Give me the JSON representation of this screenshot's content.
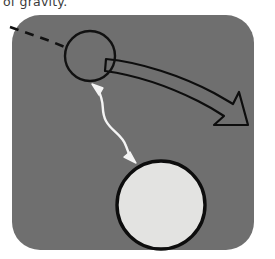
{
  "document": {
    "caption_fragment": "of gravity.",
    "figure_name": "gravitational-deflection-diagram"
  },
  "figure": {
    "panel": {
      "label": "illustration-panel",
      "fill": "#6f6f6f",
      "x": 12,
      "y": 15,
      "width": 242,
      "height": 235,
      "corner_radius": 28
    },
    "small_body": {
      "label": "small-circle-object",
      "cx": 90,
      "cy": 56,
      "r": 25,
      "fill": "none",
      "stroke": "#111111",
      "stroke_width": 2.4
    },
    "large_body": {
      "label": "large-circle-mass",
      "cx": 161,
      "cy": 205,
      "r": 44,
      "fill": "#e3e3e1",
      "stroke": "#0d0d0d",
      "stroke_width": 3.4
    },
    "incoming_path": {
      "label": "dashed-incoming-trajectory",
      "stroke": "#111111",
      "stroke_width": 2.6,
      "dash_pattern": "9 7",
      "start_x": 10,
      "start_y": 27,
      "end_x": 66,
      "end_y": 48
    },
    "deflected_path": {
      "label": "curved-deflection-arrow",
      "stroke": "#0d0d0d",
      "stroke_width": 2.2,
      "fill": "#6f6f6f",
      "tail_x": 108,
      "tail_y": 63,
      "tip_x": 246,
      "tip_y": 122
    },
    "attraction_arrow": {
      "label": "wavy-gravity-arrow",
      "stroke": "#f4f4f4",
      "stroke_width": 2.4,
      "double_headed": true,
      "top_x": 96,
      "top_y": 88,
      "bottom_x": 131,
      "bottom_y": 157
    }
  },
  "colors": {
    "panel_gray": "#6f6f6f",
    "ink_black": "#0d0d0d",
    "body_white": "#e3e3e1",
    "arrow_white": "#f4f4f4",
    "page_white": "#ffffff",
    "text_gray": "#3a3a3a"
  }
}
